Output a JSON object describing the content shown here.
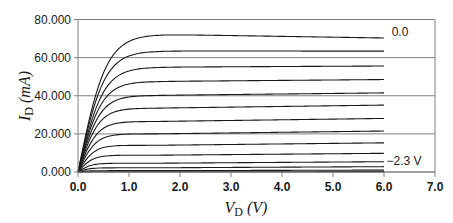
{
  "chart_data": {
    "type": "line",
    "title": "",
    "xlabel": "V_D (V)",
    "ylabel": "I_D (mA)",
    "xlabel_parts": {
      "main": "V",
      "sub": "D",
      "unit": "(V)"
    },
    "ylabel_parts": {
      "main": "I",
      "sub": "D",
      "unit": "(mA)"
    },
    "xlim": [
      0,
      7
    ],
    "ylim": [
      0,
      80
    ],
    "x_ticks": [
      "0.0",
      "1.0",
      "2.0",
      "3.0",
      "4.0",
      "5.0",
      "6.0",
      "7.0"
    ],
    "y_ticks": [
      "0.000",
      "20.000",
      "40.000",
      "60.000",
      "80.000"
    ],
    "grid": {
      "horizontal": true,
      "vertical": false
    },
    "legend": "none",
    "annotations": [
      {
        "text": "0.0",
        "x": 6.15,
        "y": 71.5
      },
      {
        "text": "−2.3 V",
        "x": 6.05,
        "y": 3.5
      }
    ],
    "series_note": "Drain current vs drain voltage for gate voltages from 0.0 V (top) to -2.3 V (bottom)",
    "series": [
      {
        "name": "VG = 0.0 V",
        "knee": 0.55,
        "peak": 72.2,
        "end": 70.3
      },
      {
        "name": "",
        "knee": 0.52,
        "peak": 63.5,
        "end": 63.4
      },
      {
        "name": "",
        "knee": 0.5,
        "peak": 55.0,
        "end": 55.6
      },
      {
        "name": "",
        "knee": 0.47,
        "peak": 47.5,
        "end": 48.5
      },
      {
        "name": "",
        "knee": 0.44,
        "peak": 40.2,
        "end": 41.5
      },
      {
        "name": "",
        "knee": 0.41,
        "peak": 33.5,
        "end": 35.1
      },
      {
        "name": "",
        "knee": 0.38,
        "peak": 26.5,
        "end": 28.1
      },
      {
        "name": "",
        "knee": 0.35,
        "peak": 20.0,
        "end": 21.5
      },
      {
        "name": "",
        "knee": 0.32,
        "peak": 14.0,
        "end": 15.3
      },
      {
        "name": "",
        "knee": 0.29,
        "peak": 8.8,
        "end": 9.8
      },
      {
        "name": "",
        "knee": 0.26,
        "peak": 4.6,
        "end": 5.4
      },
      {
        "name": "",
        "knee": 0.23,
        "peak": 2.2,
        "end": 2.8
      },
      {
        "name": "",
        "knee": 0.2,
        "peak": 0.7,
        "end": 1.0
      },
      {
        "name": "VG = -2.3 V",
        "knee": 0.18,
        "peak": 0.1,
        "end": 0.2
      }
    ],
    "x_range_data": [
      0,
      6
    ],
    "colors": {
      "curve": "#1a1a1a",
      "grid": "#808080",
      "axis": "#808080"
    }
  }
}
